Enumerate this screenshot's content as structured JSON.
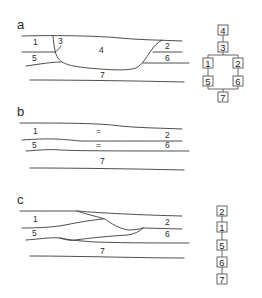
{
  "figure": {
    "panels": [
      {
        "id": "a",
        "label": "a",
        "units": [
          {
            "text": "1",
            "x": 33,
            "y": 45
          },
          {
            "text": "3",
            "x": 58,
            "y": 43
          },
          {
            "text": "4",
            "x": 99,
            "y": 52
          },
          {
            "text": "2",
            "x": 165,
            "y": 48
          },
          {
            "text": "5",
            "x": 32,
            "y": 60
          },
          {
            "text": "6",
            "x": 165,
            "y": 60
          },
          {
            "text": "7",
            "x": 100,
            "y": 77
          }
        ],
        "sequence_type": "branching",
        "sequence": {
          "top": [
            "4",
            "3"
          ],
          "left_branch": [
            "1",
            "5"
          ],
          "right_branch": [
            "2",
            "6"
          ],
          "bottom": [
            "7"
          ]
        }
      },
      {
        "id": "b",
        "label": "b",
        "units": [
          {
            "text": "1",
            "x": 33,
            "y": 134
          },
          {
            "text": "=",
            "x": 96,
            "y": 134
          },
          {
            "text": "2",
            "x": 165,
            "y": 139
          },
          {
            "text": "5",
            "x": 32,
            "y": 149
          },
          {
            "text": "=",
            "x": 96,
            "y": 149
          },
          {
            "text": "6",
            "x": 165,
            "y": 149
          },
          {
            "text": "7",
            "x": 100,
            "y": 167
          }
        ]
      },
      {
        "id": "c",
        "label": "c",
        "units": [
          {
            "text": "1",
            "x": 33,
            "y": 222
          },
          {
            "text": "2",
            "x": 165,
            "y": 225
          },
          {
            "text": "5",
            "x": 32,
            "y": 235
          },
          {
            "text": "6",
            "x": 165,
            "y": 236
          },
          {
            "text": "7",
            "x": 100,
            "y": 253
          }
        ],
        "sequence_type": "linear",
        "sequence": [
          "2",
          "1",
          "5",
          "6",
          "7"
        ]
      }
    ]
  }
}
